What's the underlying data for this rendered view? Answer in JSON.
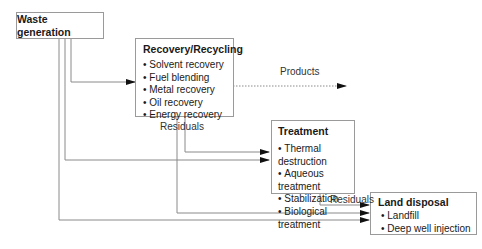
{
  "diagram": {
    "nodes": {
      "waste_generation": {
        "title": "Waste generation"
      },
      "recovery": {
        "title": "Recovery/Recycling",
        "items": [
          "Solvent recovery",
          "Fuel blending",
          "Metal recovery",
          "Oil recovery",
          "Energy recovery"
        ]
      },
      "treatment": {
        "title": "Treatment",
        "items": [
          "Thermal destruction",
          "Aqueous treatment",
          "Stabilization",
          "Biological treatment"
        ]
      },
      "land_disposal": {
        "title": "Land disposal",
        "items": [
          "Landfill",
          "Deep well injection"
        ]
      }
    },
    "edge_labels": {
      "products": "Products",
      "recovery_residuals": "Residuals",
      "treatment_residuals": "Residuals"
    },
    "colors": {
      "line": "#8a8a8a",
      "arrow": "#111111",
      "border": "#9a9a9a"
    }
  }
}
